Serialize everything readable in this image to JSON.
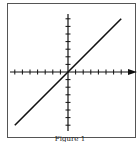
{
  "caption": "Figure 1",
  "chart_data": {
    "type": "line",
    "title": "",
    "caption": "Figure 1",
    "xlabel": "",
    "ylabel": "",
    "xlim": [
      -7,
      7
    ],
    "ylim": [
      -7,
      7
    ],
    "x_ticks_per_side": 7,
    "y_ticks_per_side": 7,
    "tick_labels": "none",
    "grid": false,
    "legend": null,
    "x_axis_arrow": true,
    "series": [
      {
        "name": "y = x",
        "x": [
          -7,
          7
        ],
        "y": [
          -7,
          7
        ]
      }
    ]
  },
  "colors": {
    "line": "#111111",
    "axis": "#111111",
    "frame": "#555555",
    "background": "#ffffff"
  }
}
